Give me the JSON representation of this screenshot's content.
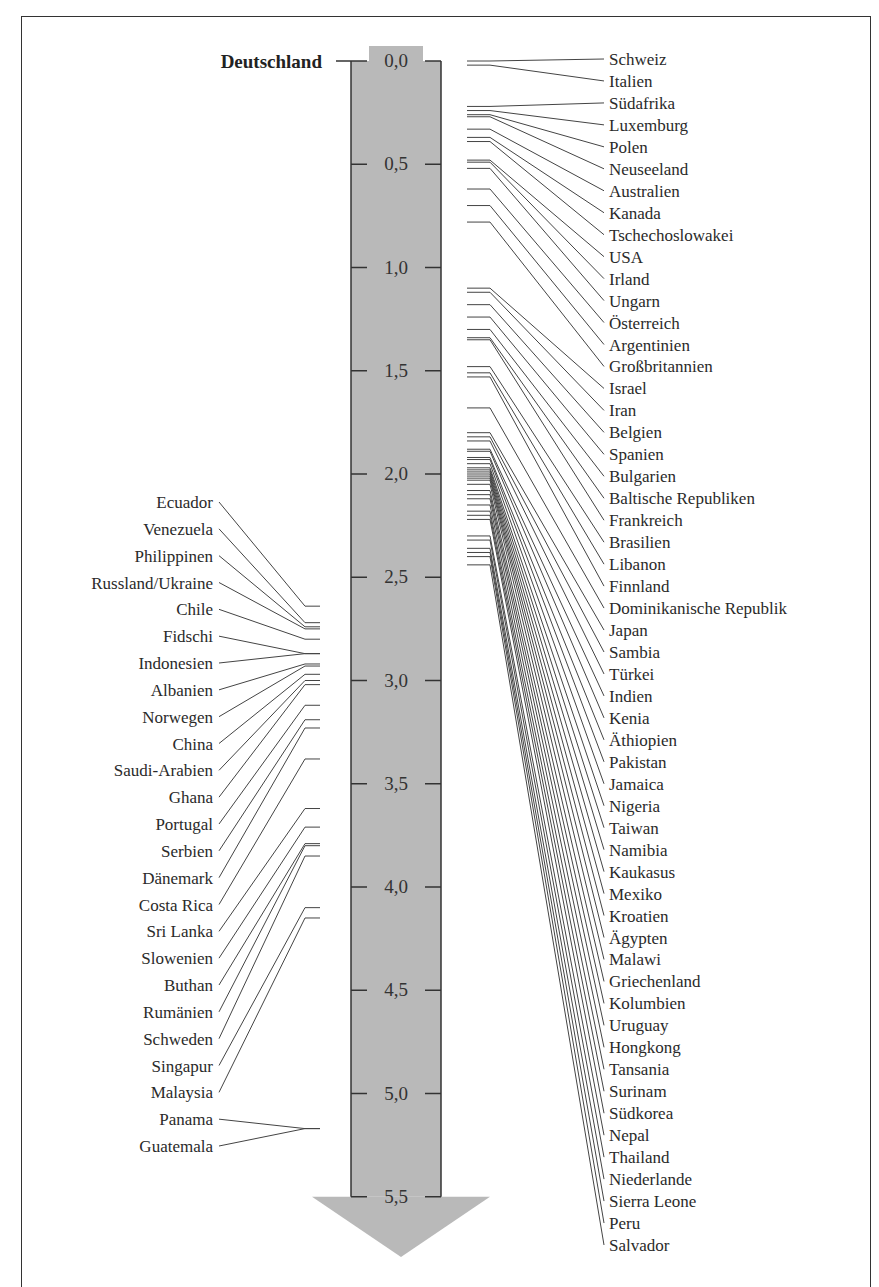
{
  "chart_data": {
    "type": "scale-ranking",
    "title": "",
    "reference": {
      "label": "Deutschland",
      "value": 0.0
    },
    "axis": {
      "direction": "down",
      "min": 0.0,
      "max": 5.5,
      "ticks": [
        "0,0",
        "0,5",
        "1,0",
        "1,5",
        "2,0",
        "2,5",
        "3,0",
        "3,5",
        "4,0",
        "4,5",
        "5,0",
        "5,5"
      ],
      "tick_values": [
        0.0,
        0.5,
        1.0,
        1.5,
        2.0,
        2.5,
        3.0,
        3.5,
        4.0,
        4.5,
        5.0,
        5.5
      ]
    },
    "colors": {
      "bar": "#b9b9b9",
      "line": "#444444",
      "text": "#2a2a2a"
    },
    "right_series": [
      {
        "name": "Schweiz",
        "value": 0.0
      },
      {
        "name": "Italien",
        "value": 0.02
      },
      {
        "name": "Südafrika",
        "value": 0.22
      },
      {
        "name": "Luxemburg",
        "value": 0.24
      },
      {
        "name": "Polen",
        "value": 0.26
      },
      {
        "name": "Neuseeland",
        "value": 0.27
      },
      {
        "name": "Australien",
        "value": 0.33
      },
      {
        "name": "Kanada",
        "value": 0.37
      },
      {
        "name": "Tschechoslowakei",
        "value": 0.39
      },
      {
        "name": "USA",
        "value": 0.48
      },
      {
        "name": "Irland",
        "value": 0.49
      },
      {
        "name": "Ungarn",
        "value": 0.52
      },
      {
        "name": "Österreich",
        "value": 0.62
      },
      {
        "name": "Argentinien",
        "value": 0.7
      },
      {
        "name": "Großbritannien",
        "value": 0.78
      },
      {
        "name": "Israel",
        "value": 1.1
      },
      {
        "name": "Iran",
        "value": 1.12
      },
      {
        "name": "Belgien",
        "value": 1.18
      },
      {
        "name": "Spanien",
        "value": 1.24
      },
      {
        "name": "Bulgarien",
        "value": 1.3
      },
      {
        "name": "Baltische Republiken",
        "value": 1.34
      },
      {
        "name": "Frankreich",
        "value": 1.35
      },
      {
        "name": "Brasilien",
        "value": 1.48
      },
      {
        "name": "Libanon",
        "value": 1.51
      },
      {
        "name": "Finnland",
        "value": 1.53
      },
      {
        "name": "Dominikanische Republik",
        "value": 1.68
      },
      {
        "name": "Japan",
        "value": 1.8
      },
      {
        "name": "Sambia",
        "value": 1.82
      },
      {
        "name": "Türkei",
        "value": 1.84
      },
      {
        "name": "Indien",
        "value": 1.88
      },
      {
        "name": "Kenia",
        "value": 1.89
      },
      {
        "name": "Äthiopien",
        "value": 1.92
      },
      {
        "name": "Pakistan",
        "value": 1.93
      },
      {
        "name": "Jamaica",
        "value": 1.95
      },
      {
        "name": "Nigeria",
        "value": 1.97
      },
      {
        "name": "Taiwan",
        "value": 1.98
      },
      {
        "name": "Namibia",
        "value": 1.99
      },
      {
        "name": "Kaukasus",
        "value": 2.0
      },
      {
        "name": "Mexiko",
        "value": 2.01
      },
      {
        "name": "Kroatien",
        "value": 2.02
      },
      {
        "name": "Ägypten",
        "value": 2.03
      },
      {
        "name": "Malawi",
        "value": 2.05
      },
      {
        "name": "Griechenland",
        "value": 2.08
      },
      {
        "name": "Kolumbien",
        "value": 2.1
      },
      {
        "name": "Uruguay",
        "value": 2.12
      },
      {
        "name": "Hongkong",
        "value": 2.15
      },
      {
        "name": "Tansania",
        "value": 2.18
      },
      {
        "name": "Surinam",
        "value": 2.2
      },
      {
        "name": "Südkorea",
        "value": 2.22
      },
      {
        "name": "Nepal",
        "value": 2.3
      },
      {
        "name": "Thailand",
        "value": 2.32
      },
      {
        "name": "Niederlande",
        "value": 2.36
      },
      {
        "name": "Sierra Leone",
        "value": 2.38
      },
      {
        "name": "Peru",
        "value": 2.4
      },
      {
        "name": "Salvador",
        "value": 2.44
      }
    ],
    "left_series": [
      {
        "name": "Ecuador",
        "value": 2.64
      },
      {
        "name": "Venezuela",
        "value": 2.72
      },
      {
        "name": "Philippinen",
        "value": 2.74
      },
      {
        "name": "Russland/Ukraine",
        "value": 2.75
      },
      {
        "name": "Chile",
        "value": 2.8
      },
      {
        "name": "Fidschi",
        "value": 2.87
      },
      {
        "name": "Indonesien",
        "value": 2.87
      },
      {
        "name": "Albanien",
        "value": 2.92
      },
      {
        "name": "Norwegen",
        "value": 2.93
      },
      {
        "name": "China",
        "value": 2.97
      },
      {
        "name": "Saudi-Arabien",
        "value": 3.0
      },
      {
        "name": "Ghana",
        "value": 3.02
      },
      {
        "name": "Portugal",
        "value": 3.12
      },
      {
        "name": "Serbien",
        "value": 3.19
      },
      {
        "name": "Dänemark",
        "value": 3.23
      },
      {
        "name": "Costa Rica",
        "value": 3.38
      },
      {
        "name": "Sri Lanka",
        "value": 3.62
      },
      {
        "name": "Slowenien",
        "value": 3.71
      },
      {
        "name": "Buthan",
        "value": 3.79
      },
      {
        "name": "Rumänien",
        "value": 3.8
      },
      {
        "name": "Schweden",
        "value": 3.85
      },
      {
        "name": "Singapur",
        "value": 4.1
      },
      {
        "name": "Malaysia",
        "value": 4.15
      },
      {
        "name": "Panama",
        "value": 5.17
      },
      {
        "name": "Guatemala",
        "value": 5.17
      }
    ]
  }
}
